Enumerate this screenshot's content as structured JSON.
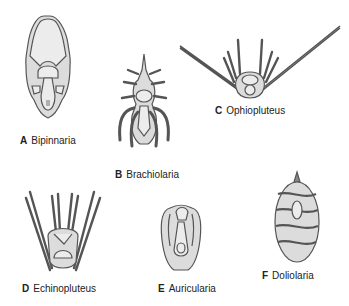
{
  "diagram": {
    "panels": [
      {
        "letter": "A",
        "name": "Bipinnaria"
      },
      {
        "letter": "B",
        "name": "Brachiolaria"
      },
      {
        "letter": "C",
        "name": "Ophiopluteus"
      },
      {
        "letter": "D",
        "name": "Echinopluteus"
      },
      {
        "letter": "E",
        "name": "Auricularia"
      },
      {
        "letter": "F",
        "name": "Doliolaria"
      }
    ],
    "colors": {
      "body_fill": "#dcdcdc",
      "outline": "#555555",
      "inner_fill": "#ececec",
      "text": "#222222"
    }
  }
}
